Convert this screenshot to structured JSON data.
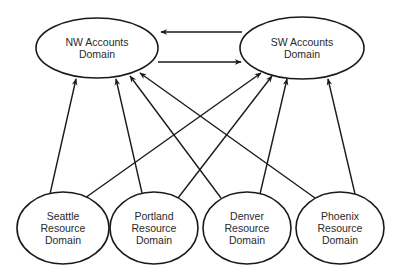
{
  "diagram": {
    "colors": {
      "stroke": "#1a1a1a",
      "text": "#2a2a2a",
      "background": "#ffffff"
    },
    "nodes": {
      "nw": {
        "line1": "NW Accounts",
        "line2": "Domain"
      },
      "sw": {
        "line1": "SW Accounts",
        "line2": "Domain"
      },
      "seattle": {
        "line1": "Seattle",
        "line2": "Resource",
        "line3": "Domain"
      },
      "portland": {
        "line1": "Portland",
        "line2": "Resource",
        "line3": "Domain"
      },
      "denver": {
        "line1": "Denver",
        "line2": "Resource",
        "line3": "Domain"
      },
      "phoenix": {
        "line1": "Phoenix",
        "line2": "Resource",
        "line3": "Domain"
      }
    },
    "edges": [
      {
        "from": "SW Accounts Domain",
        "to": "NW Accounts Domain"
      },
      {
        "from": "NW Accounts Domain",
        "to": "SW Accounts Domain"
      },
      {
        "from": "Seattle Resource Domain",
        "to": "NW Accounts Domain"
      },
      {
        "from": "Seattle Resource Domain",
        "to": "SW Accounts Domain"
      },
      {
        "from": "Portland Resource Domain",
        "to": "NW Accounts Domain"
      },
      {
        "from": "Portland Resource Domain",
        "to": "SW Accounts Domain"
      },
      {
        "from": "Denver Resource Domain",
        "to": "NW Accounts Domain"
      },
      {
        "from": "Denver Resource Domain",
        "to": "SW Accounts Domain"
      },
      {
        "from": "Phoenix Resource Domain",
        "to": "NW Accounts Domain"
      },
      {
        "from": "Phoenix Resource Domain",
        "to": "SW Accounts Domain"
      }
    ]
  }
}
